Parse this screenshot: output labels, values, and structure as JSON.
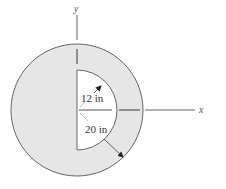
{
  "diagram": {
    "colors": {
      "fill": "#e6e6e6",
      "outline": "#666666",
      "cutout": "#ffffff",
      "line": "#555555"
    },
    "axes": {
      "x_label": "x",
      "y_label": "y"
    },
    "dimensions": {
      "inner_radius_label": "12 in",
      "outer_radius_label": "20 in"
    }
  }
}
